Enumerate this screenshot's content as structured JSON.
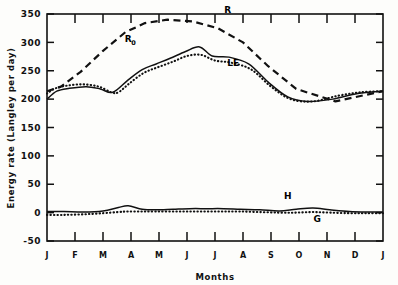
{
  "chart_data": {
    "type": "line",
    "title": "",
    "xlabel": "Months",
    "ylabel": "Energy rate (Langley per day)",
    "ylim": [
      -50,
      350
    ],
    "yticks": [
      -50,
      0,
      50,
      100,
      150,
      200,
      250,
      300,
      350
    ],
    "ytick_labels": [
      "-50",
      "0",
      "50",
      "100",
      "150",
      "200",
      "250",
      "300",
      "350"
    ],
    "categories": [
      "J",
      "F",
      "M",
      "A",
      "M",
      "J",
      "J",
      "A",
      "S",
      "O",
      "N",
      "D",
      "J"
    ],
    "xtick_labels": [
      "J",
      "F",
      "M",
      "A",
      "M",
      "J",
      "J",
      "A",
      "S",
      "O",
      "N",
      "D",
      "J"
    ],
    "grid": false,
    "legend_position": "inline-annotations",
    "series": [
      {
        "name": "R",
        "label": "R",
        "style": "dashed",
        "label_x": 6.45,
        "label_y": 352,
        "values": [
          214,
          222,
          248,
          285,
          318,
          334,
          340,
          337,
          325,
          300,
          258,
          218,
          196,
          214
        ],
        "x": [
          0,
          0.5,
          1.2,
          2.0,
          2.8,
          3.5,
          4.3,
          5.2,
          6.1,
          7.0,
          7.9,
          8.9,
          10.3,
          12.0
        ]
      },
      {
        "name": "R_0",
        "label": "R",
        "sublabel": "0",
        "style": "solid",
        "label_x": 2.9,
        "label_y": 301,
        "values": [
          200,
          214,
          219,
          222,
          218,
          212,
          234,
          252,
          262,
          272,
          284,
          292,
          276,
          274,
          262,
          230,
          204,
          196,
          200,
          210,
          214
        ],
        "x": [
          0,
          0.35,
          0.8,
          1.4,
          1.9,
          2.35,
          2.9,
          3.4,
          3.9,
          4.4,
          4.95,
          5.45,
          5.9,
          6.5,
          7.2,
          7.9,
          8.6,
          9.3,
          10.2,
          11.1,
          12.0
        ]
      },
      {
        "name": "LE",
        "label": "LE",
        "style": "dotted",
        "label_x": 6.65,
        "label_y": 258,
        "values": [
          210,
          219,
          224,
          226,
          222,
          212,
          212,
          228,
          246,
          256,
          266,
          276,
          278,
          268,
          264,
          252,
          222,
          200,
          196,
          206,
          212,
          214
        ],
        "x": [
          0,
          0.3,
          0.75,
          1.3,
          1.85,
          2.3,
          2.55,
          2.95,
          3.45,
          3.95,
          4.5,
          5.0,
          5.5,
          6.0,
          6.6,
          7.3,
          8.0,
          8.7,
          9.5,
          10.4,
          11.2,
          12.0
        ]
      },
      {
        "name": "H",
        "label": "H",
        "style": "solid",
        "label_x": 8.6,
        "label_y": 24,
        "values": [
          2,
          2,
          1,
          3,
          9,
          12,
          6,
          5,
          6,
          7,
          7,
          7,
          6,
          5,
          3,
          6,
          8,
          5,
          2,
          1,
          1
        ],
        "x": [
          0,
          0.6,
          1.3,
          2.0,
          2.55,
          2.9,
          3.4,
          3.9,
          4.5,
          5.1,
          5.7,
          6.3,
          6.9,
          7.6,
          8.3,
          8.9,
          9.5,
          10.1,
          10.8,
          11.4,
          12.0
        ]
      },
      {
        "name": "G",
        "label": "G",
        "style": "dotted",
        "label_x": 9.65,
        "label_y": -17,
        "values": [
          -4,
          -4,
          -3,
          -1,
          1,
          2,
          2,
          2,
          2,
          2,
          2,
          2,
          2,
          1,
          0,
          0,
          1,
          0,
          -1,
          -1,
          -1
        ],
        "x": [
          0,
          0.6,
          1.3,
          2.0,
          2.55,
          2.9,
          3.4,
          3.9,
          4.5,
          5.1,
          5.7,
          6.3,
          6.9,
          7.6,
          8.3,
          8.9,
          9.5,
          10.1,
          10.8,
          11.4,
          12.0
        ]
      }
    ]
  },
  "annotations": {
    "r_label": "R",
    "r0_label": "R",
    "r0_sub": "0",
    "le_label": "LE",
    "h_label": "H",
    "g_label": "G"
  },
  "axes": {
    "y_title": "Energy rate (Langley per day)",
    "x_title": "Months"
  },
  "colors": {
    "line": "#111111",
    "background": "#fdfdfb",
    "axis": "#111111"
  }
}
